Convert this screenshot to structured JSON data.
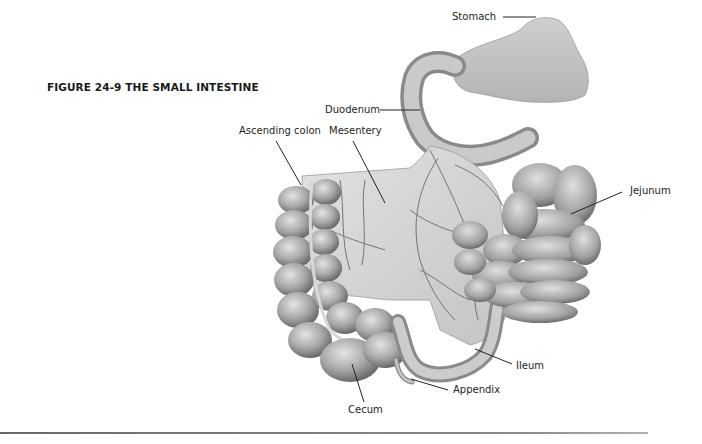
{
  "figure": {
    "title": "FIGURE 24-9 THE SMALL INTESTINE",
    "style": "grayscale pencil illustration"
  },
  "labels": [
    {
      "id": "stomach",
      "text": "Stomach",
      "x": 452,
      "y": 11,
      "line": [
        503,
        17,
        536,
        17
      ]
    },
    {
      "id": "duodenum",
      "text": "Duodenum",
      "x": 325,
      "y": 104,
      "line": [
        380,
        110,
        420,
        110
      ]
    },
    {
      "id": "ascending-colon",
      "text": "Ascending colon",
      "x": 239,
      "y": 125,
      "line": [
        276,
        141,
        301,
        185
      ]
    },
    {
      "id": "mesentery",
      "text": "Mesentery",
      "x": 329,
      "y": 125,
      "line": [
        353,
        141,
        385,
        203
      ]
    },
    {
      "id": "jejunum",
      "text": "Jejunum",
      "x": 630,
      "y": 185,
      "line": [
        622,
        192,
        571,
        214
      ]
    },
    {
      "id": "ileum",
      "text": "Ileum",
      "x": 516,
      "y": 360,
      "line": [
        512,
        364,
        475,
        349
      ]
    },
    {
      "id": "appendix",
      "text": "Appendix",
      "x": 453,
      "y": 384,
      "line": [
        448,
        390,
        411,
        379
      ]
    },
    {
      "id": "cecum",
      "text": "Cecum",
      "x": 348,
      "y": 404,
      "line": [
        364,
        402,
        352,
        364
      ]
    }
  ],
  "colors": {
    "text": "#1e1e1e",
    "leader_line": "#222222",
    "organ_light": "#d6d6d6",
    "organ_mid": "#a8a8a8",
    "organ_dark": "#6e6e6e",
    "vessel": "#5a5a5a",
    "rule": "#777777"
  }
}
